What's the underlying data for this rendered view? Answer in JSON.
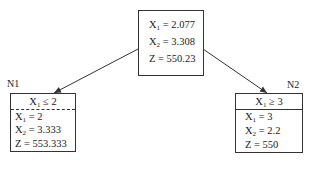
{
  "root": {
    "lines": [
      {
        "var": "X",
        "sub": "1",
        "rest": " = 2.077"
      },
      {
        "var": "X",
        "sub": "2",
        "rest": " = 3.308"
      },
      {
        "var": "Z",
        "sub": "",
        "rest": "  = 550.23"
      }
    ]
  },
  "left_node": {
    "label": "N1",
    "constraint": {
      "var": "X",
      "sub": "1",
      "rest": " ≤ 2"
    },
    "lines": [
      {
        "var": "X",
        "sub": "1",
        "rest": " = 2"
      },
      {
        "var": "X",
        "sub": "2",
        "rest": " = 3.333"
      },
      {
        "var": "Z",
        "sub": "",
        "rest": "  = 553.333"
      }
    ]
  },
  "right_node": {
    "label": "N2",
    "constraint": {
      "var": "X",
      "sub": "1",
      "rest": " ≥ 3"
    },
    "lines": [
      {
        "var": "X",
        "sub": "1",
        "rest": " = 3"
      },
      {
        "var": "X",
        "sub": "2",
        "rest": " = 2.2"
      },
      {
        "var": "Z",
        "sub": "",
        "rest": "  = 550"
      }
    ]
  },
  "colors": {
    "stroke": "#333333",
    "background": "#ffffff"
  }
}
